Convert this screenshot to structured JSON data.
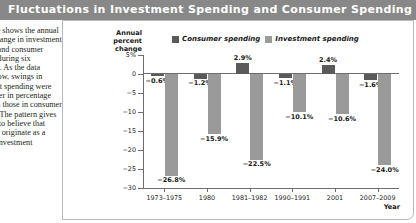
{
  "header": {
    "title": "Fluctuations in Investment Spending and Consumer Spending",
    "bar_color": "#888888",
    "text_color": "#ffffff"
  },
  "caption": {
    "text": "The figure shows the annual percent change in investment spending and consumer spending during six recessions. As the data clearly show, swings in investment spending were much larger in percentage terms than those in consumer spending. The pattern gives us reason to believe that recessions originate as a slump in investment spending."
  },
  "chart_data": {
    "type": "bar",
    "title": "Fluctuations in Investment Spending and Consumer Spending",
    "categories": [
      "1973–1975",
      "1980",
      "1981–1982",
      "1990–1991",
      "2001",
      "2007–2009"
    ],
    "series": [
      {
        "name": "Consumer spending",
        "color": "#5a5a5a",
        "values": [
          -0.6,
          -1.2,
          2.9,
          -1.1,
          2.4,
          -1.6
        ],
        "labels": [
          "−0.6%",
          "−1.2%",
          "2.9%",
          "−1.1%",
          "2.4%",
          "−1.6%"
        ]
      },
      {
        "name": "Investment spending",
        "color": "#9a9a9a",
        "values": [
          -26.8,
          -15.9,
          -22.5,
          -10.1,
          -10.6,
          -24.0
        ],
        "labels": [
          "−26.8%",
          "−15.9%",
          "−22.5%",
          "−10.1%",
          "−10.6%",
          "−24.0%"
        ]
      }
    ],
    "xlabel": "Year",
    "ylabel": "Annual percent change",
    "ylim": [
      -30,
      5
    ],
    "yticks": [
      5,
      0,
      -5,
      -10,
      -15,
      -20,
      -25,
      -30
    ],
    "ytick_labels": [
      "5%",
      "0",
      "−5",
      "−10",
      "−15",
      "−20",
      "−25",
      "−30"
    ],
    "grid": false,
    "legend_position": "top-center"
  },
  "axis": {
    "y_title_line1": "Annual",
    "y_title_line2": "percent",
    "y_title_line3": "change",
    "x_title": "Year"
  }
}
